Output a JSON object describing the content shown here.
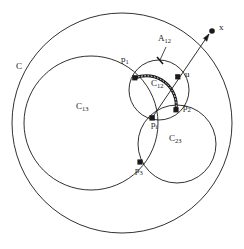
{
  "figure": {
    "type": "geometric-diagram",
    "stroke_color": "#1a1a1a",
    "highlight_color": "#1a1a1a",
    "background": "#ffffff"
  },
  "circles": [
    {
      "id": "C",
      "label": "C",
      "cx": 122,
      "cy": 123,
      "r": 110,
      "label_x": 17,
      "label_y": 63
    },
    {
      "id": "C13",
      "label": "C",
      "sub": "13",
      "cx": 91,
      "cy": 123,
      "r": 67,
      "label_x": 76,
      "label_y": 103
    },
    {
      "id": "C12",
      "label": "C",
      "sub": "12",
      "cx": 159,
      "cy": 90,
      "r": 30,
      "label_x": 152,
      "label_y": 84
    },
    {
      "id": "C23",
      "label": "C",
      "sub": "23",
      "cx": 177,
      "cy": 144,
      "r": 39,
      "label_x": 170,
      "label_y": 138
    }
  ],
  "points": [
    {
      "id": "p1",
      "label": "p",
      "sub": "1",
      "x": 135,
      "y": 78,
      "label_x": 122,
      "label_y": 59
    },
    {
      "id": "p2",
      "label": "p",
      "sub": "2",
      "x": 176,
      "y": 110,
      "label_x": 184,
      "label_y": 110
    },
    {
      "id": "p3",
      "label": "p",
      "sub": "3",
      "x": 140,
      "y": 162,
      "label_x": 137,
      "label_y": 167
    },
    {
      "id": "pi",
      "label": "p",
      "sub": "i",
      "x": 152,
      "y": 118,
      "label_x": 152,
      "label_y": 119
    },
    {
      "id": "u",
      "label": "u",
      "sub": "",
      "x": 178,
      "y": 77,
      "label_x": 186,
      "label_y": 73
    },
    {
      "id": "x",
      "label": "x",
      "sub": "",
      "x": 212,
      "y": 31,
      "label_x": 220,
      "label_y": 24
    }
  ],
  "arcs": [
    {
      "id": "A12",
      "label": "A",
      "sub": "12",
      "label_x": 161,
      "label_y": 41,
      "from": "p1",
      "to": "p2",
      "on_circle": "C12",
      "tick_x": 160,
      "tick_y": 61
    }
  ],
  "ray": {
    "id": "ray-pi-x",
    "from": "pi",
    "through": "u",
    "to": "x",
    "has_arrowhead": true
  }
}
